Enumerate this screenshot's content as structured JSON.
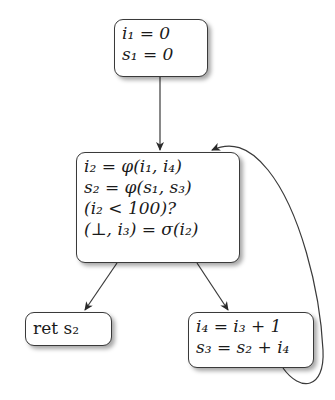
{
  "diagram": {
    "type": "control-flow-graph (SSA form)",
    "nodes": [
      {
        "id": "entry",
        "lines": [
          {
            "var": "i",
            "sub": "1",
            "rhs": " = 0"
          },
          {
            "var": "s",
            "sub": "1",
            "rhs": " = 0"
          }
        ]
      },
      {
        "id": "loop-header",
        "lines": [
          {
            "text": "i₂ = φ(i₁, i₄)"
          },
          {
            "text": "s₂ = φ(s₁, s₃)"
          },
          {
            "text": "(i₂ < 100)?"
          },
          {
            "text": "(⊥, i₃) = σ(i₂)"
          }
        ]
      },
      {
        "id": "exit",
        "lines": [
          {
            "text": "ret s₂"
          }
        ]
      },
      {
        "id": "loop-body",
        "lines": [
          {
            "text": "i₄ = i₃ + 1"
          },
          {
            "text": "s₃ = s₂ + i₄"
          }
        ]
      }
    ],
    "edges": [
      {
        "from": "entry",
        "to": "loop-header"
      },
      {
        "from": "loop-header",
        "to": "exit"
      },
      {
        "from": "loop-header",
        "to": "loop-body"
      },
      {
        "from": "loop-body",
        "to": "loop-header",
        "style": "back-edge curve"
      }
    ],
    "colors": {
      "stroke": "#3a3a3a",
      "background": "#ffffff",
      "text": "#1a1a1a"
    }
  },
  "text": {
    "entry_l1": "i₁ = 0",
    "entry_l2": "s₁ = 0",
    "header_l1": "i₂ = φ(i₁, i₄)",
    "header_l2": "s₂ = φ(s₁, s₃)",
    "header_l3": "(i₂ < 100)?",
    "header_l4": "(⊥, i₃) = σ(i₂)",
    "exit_l1": "ret s₂",
    "body_l1": "i₄ = i₃ + 1",
    "body_l2": "s₃ = s₂ + i₄"
  }
}
